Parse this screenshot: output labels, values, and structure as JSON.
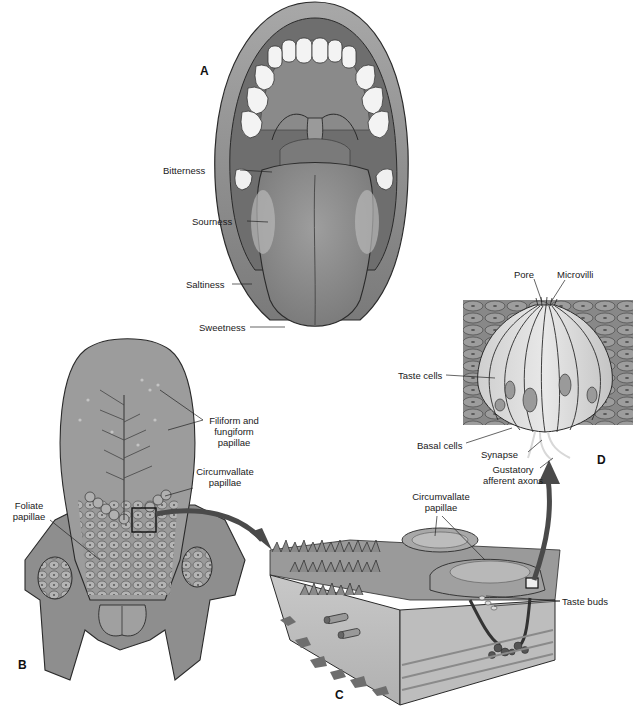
{
  "panels": {
    "a": {
      "letter": "A",
      "title": "Open mouth with tongue taste regions",
      "labels": {
        "bitterness": "Bitterness",
        "sourness": "Sourness",
        "saltiness": "Saltiness",
        "sweetness": "Sweetness"
      }
    },
    "b": {
      "letter": "B",
      "title": "Dorsal surface of tongue",
      "labels": {
        "filiform_line1": "Filiform and",
        "filiform_line2": "fungiform",
        "filiform_line3": "papillae",
        "circumvallate_line1": "Circumvallate",
        "circumvallate_line2": "papillae",
        "foliate_line1": "Foliate",
        "foliate_line2": "papillae"
      }
    },
    "c": {
      "letter": "C",
      "title": "Cross section of circumvallate papillae",
      "labels": {
        "circumvallate_line1": "Circumvallate",
        "circumvallate_line2": "papillae",
        "taste_buds": "Taste buds"
      }
    },
    "d": {
      "letter": "D",
      "title": "Taste bud detail",
      "labels": {
        "pore": "Pore",
        "microvilli": "Microvilli",
        "taste_cells": "Taste cells",
        "basal_cells": "Basal cells",
        "synapse": "Synapse",
        "gustatory_line1": "Gustatory",
        "gustatory_line2": "afferent axons"
      }
    }
  },
  "colors": {
    "tissue": "#8c8c8c",
    "tissue_light": "#b5b5b5",
    "tissue_dark": "#5e5e5e",
    "teeth": "#f4f4f4",
    "outline": "#2a2a2a",
    "arrow": "#4a4a4a"
  }
}
